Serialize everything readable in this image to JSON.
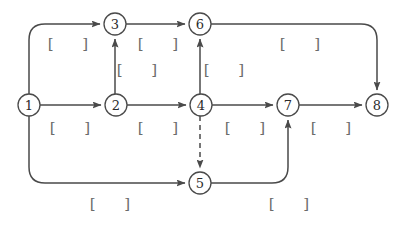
{
  "diagram": {
    "type": "directed-graph",
    "title": "",
    "background_color": "#ffffff",
    "stroke_color": "#4a4a4a",
    "label_color": "#6b6b6b",
    "nodes": [
      {
        "id": "1",
        "label": "1",
        "cx": 29,
        "cy": 105,
        "r": 11
      },
      {
        "id": "2",
        "label": "2",
        "cx": 116,
        "cy": 105,
        "r": 11
      },
      {
        "id": "3",
        "label": "3",
        "cx": 115,
        "cy": 24,
        "r": 11
      },
      {
        "id": "4",
        "label": "4",
        "cx": 201,
        "cy": 105,
        "r": 11
      },
      {
        "id": "5",
        "label": "5",
        "cx": 200,
        "cy": 183,
        "r": 11
      },
      {
        "id": "6",
        "label": "6",
        "cx": 200,
        "cy": 24,
        "r": 11
      },
      {
        "id": "7",
        "label": "7",
        "cx": 288,
        "cy": 105,
        "r": 11
      },
      {
        "id": "8",
        "label": "8",
        "cx": 377,
        "cy": 105,
        "r": 11
      }
    ],
    "edges": [
      {
        "id": "e1-3",
        "from": "1",
        "to": "3",
        "style": "solid",
        "path": "M 29 94 L 29 40 Q 29 24 45 24 L 100 24"
      },
      {
        "id": "e1-2",
        "from": "1",
        "to": "2",
        "style": "solid",
        "path": "M 40 105 L 101 105"
      },
      {
        "id": "e1-5",
        "from": "1",
        "to": "5",
        "style": "solid",
        "path": "M 29 116 L 29 167 Q 29 183 45 183 L 185 183"
      },
      {
        "id": "e2-3",
        "from": "2",
        "to": "3",
        "style": "solid",
        "path": "M 115 94 L 115 39"
      },
      {
        "id": "e2-4",
        "from": "2",
        "to": "4",
        "style": "solid",
        "path": "M 127 105 L 186 105"
      },
      {
        "id": "e3-6",
        "from": "3",
        "to": "6",
        "style": "solid",
        "path": "M 126 24 L 185 24"
      },
      {
        "id": "e4-6",
        "from": "4",
        "to": "6",
        "style": "solid",
        "path": "M 200 94 L 200 39"
      },
      {
        "id": "e4-5",
        "from": "4",
        "to": "5",
        "style": "dashed",
        "path": "M 200 116 L 200 168"
      },
      {
        "id": "e4-7",
        "from": "4",
        "to": "7",
        "style": "solid",
        "path": "M 212 105 L 273 105"
      },
      {
        "id": "e5-7",
        "from": "5",
        "to": "7",
        "style": "solid",
        "path": "M 211 183 L 272 183 Q 288 183 288 167 L 288 120"
      },
      {
        "id": "e6-8",
        "from": "6",
        "to": "8",
        "style": "solid",
        "path": "M 211 24 L 361 24 Q 377 24 377 40 L 377 90"
      },
      {
        "id": "e7-8",
        "from": "7",
        "to": "8",
        "style": "solid",
        "path": "M 299 105 L 362 105"
      }
    ],
    "edge_labels": [
      {
        "id": "lbl-1-3",
        "for_edge": "e1-3",
        "text": "[      ]",
        "x": 68,
        "y": 44
      },
      {
        "id": "lbl-3-6",
        "for_edge": "e3-6",
        "text": "[      ]",
        "x": 158,
        "y": 44
      },
      {
        "id": "lbl-6-8",
        "for_edge": "e6-8",
        "text": "[      ]",
        "x": 300,
        "y": 44
      },
      {
        "id": "lbl-2-3",
        "for_edge": "e2-3",
        "text": "[      ]",
        "x": 137,
        "y": 70
      },
      {
        "id": "lbl-4-6",
        "for_edge": "e4-6",
        "text": "[      ]",
        "x": 224,
        "y": 70
      },
      {
        "id": "lbl-1-2",
        "for_edge": "e1-2",
        "text": "[      ]",
        "x": 70,
        "y": 128
      },
      {
        "id": "lbl-2-4",
        "for_edge": "e2-4",
        "text": "[      ]",
        "x": 158,
        "y": 128
      },
      {
        "id": "lbl-4-7",
        "for_edge": "e4-7",
        "text": "[      ]",
        "x": 245,
        "y": 128
      },
      {
        "id": "lbl-7-8",
        "for_edge": "e7-8",
        "text": "[      ]",
        "x": 331,
        "y": 128
      },
      {
        "id": "lbl-1-5",
        "for_edge": "e1-5",
        "text": "[      ]",
        "x": 110,
        "y": 204
      },
      {
        "id": "lbl-5-7",
        "for_edge": "e5-7",
        "text": "[      ]",
        "x": 289,
        "y": 204
      }
    ]
  }
}
